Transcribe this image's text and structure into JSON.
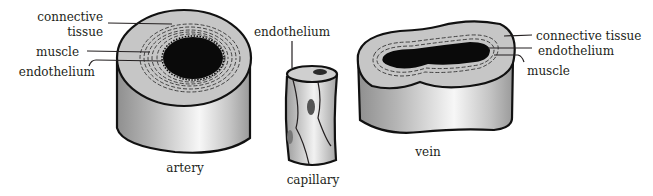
{
  "figure": {
    "colors": {
      "ink": "#231f20",
      "wall_light": "#c8c8c8",
      "wall_mid": "#a9a9a9",
      "wall_highlight": "#f4f4f4",
      "lumen": "#0a0a0a",
      "background": "#ffffff"
    }
  },
  "artery": {
    "caption": "artery",
    "labels": {
      "connective_tissue_line1": "connective",
      "connective_tissue_line2": "tissue",
      "muscle": "muscle",
      "endothelium": "endothelium"
    }
  },
  "capillary": {
    "caption": "capillary",
    "labels": {
      "endothelium": "endothelium"
    }
  },
  "vein": {
    "caption": "vein",
    "labels": {
      "connective_tissue": "connective tissue",
      "endothelium": "endothelium",
      "muscle": "muscle"
    }
  }
}
